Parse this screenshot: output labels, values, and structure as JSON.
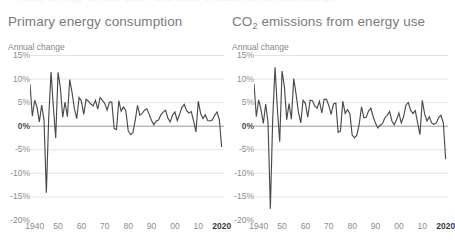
{
  "cut_text": "Primary energy consumption and CO2 emissions, annual change",
  "palette": {
    "background": "#ffffff",
    "title_color": "#7a7a7e",
    "axis_label_color": "#8a8a8e",
    "zero_label_color": "#4a4a4e",
    "gridline_color": "#e3e3e6",
    "zeroline_color": "#9a9a9e",
    "series_color": "#4a4a4d"
  },
  "panels": [
    {
      "id": "primary-energy-consumption",
      "title": "Primary energy consumption",
      "title_sub": "",
      "subtitle": "Annual change"
    },
    {
      "id": "co2-emissions-from-energy-use",
      "title": "CO",
      "title_sub": "2",
      "title_rest": " emissions from energy use",
      "subtitle": "Annual change"
    }
  ],
  "axes": {
    "y_ticks": [
      "15%",
      "10%",
      "5%",
      "0%",
      "-5%",
      "-10%",
      "-15%",
      "-20%"
    ],
    "y_values": [
      15,
      10,
      5,
      0,
      -5,
      -10,
      -15,
      -20
    ],
    "y_zero_index": 3,
    "x_ticks": [
      "1940",
      "50",
      "60",
      "70",
      "80",
      "90",
      "00",
      "10",
      "2020"
    ],
    "x_tick_years": [
      1940,
      1950,
      1960,
      1970,
      1980,
      1990,
      2000,
      2010,
      2020
    ],
    "x_bold_index": 8
  },
  "chart_data": {
    "type": "line",
    "xlabel": "",
    "ylabel": "Annual change",
    "ylim": [
      -20,
      15
    ],
    "xlim": [
      1938,
      2021
    ],
    "grid": true,
    "legend": "none",
    "x": [
      1938,
      1939,
      1940,
      1941,
      1942,
      1943,
      1944,
      1945,
      1946,
      1947,
      1948,
      1949,
      1950,
      1951,
      1952,
      1953,
      1954,
      1955,
      1956,
      1957,
      1958,
      1959,
      1960,
      1961,
      1962,
      1963,
      1964,
      1965,
      1966,
      1967,
      1968,
      1969,
      1970,
      1971,
      1972,
      1973,
      1974,
      1975,
      1976,
      1977,
      1978,
      1979,
      1980,
      1981,
      1982,
      1983,
      1984,
      1985,
      1986,
      1987,
      1988,
      1989,
      1990,
      1991,
      1992,
      1993,
      1994,
      1995,
      1996,
      1997,
      1998,
      1999,
      2000,
      2001,
      2002,
      2003,
      2004,
      2005,
      2006,
      2007,
      2008,
      2009,
      2010,
      2011,
      2012,
      2013,
      2014,
      2015,
      2016,
      2017,
      2018,
      2019,
      2020
    ],
    "series": [
      {
        "name": "Primary energy consumption",
        "panel": "primary-energy-consumption",
        "values": [
          8.8,
          2.0,
          5.4,
          3.9,
          0.8,
          4.4,
          1.2,
          -14.2,
          1.7,
          11.4,
          4.0,
          -2.6,
          11.3,
          8.0,
          1.8,
          5.0,
          1.9,
          9.8,
          7.0,
          3.6,
          1.5,
          6.0,
          5.2,
          2.4,
          5.6,
          5.2,
          4.6,
          4.2,
          5.4,
          3.5,
          6.0,
          5.4,
          4.7,
          3.3,
          5.0,
          5.0,
          -0.6,
          -0.8,
          5.3,
          3.1,
          4.0,
          3.2,
          -1.0,
          -1.9,
          -1.5,
          1.1,
          4.3,
          2.2,
          2.6,
          3.3,
          3.6,
          2.4,
          1.1,
          0.2,
          1.0,
          1.2,
          2.3,
          2.9,
          3.3,
          1.6,
          0.8,
          2.3,
          2.9,
          1.1,
          2.4,
          3.9,
          4.5,
          3.2,
          2.7,
          3.0,
          1.0,
          -1.3,
          5.2,
          2.6,
          1.5,
          2.3,
          1.1,
          1.0,
          1.2,
          2.2,
          2.9,
          1.3,
          -4.5
        ]
      },
      {
        "name": "CO2 emissions from energy use",
        "panel": "co2-emissions-from-energy-use",
        "values": [
          8.9,
          1.9,
          5.5,
          3.4,
          0.5,
          4.6,
          0.6,
          -17.6,
          1.4,
          12.4,
          3.6,
          -3.4,
          11.6,
          8.3,
          1.3,
          4.7,
          1.4,
          10.0,
          6.7,
          2.9,
          0.6,
          5.4,
          4.7,
          1.8,
          5.4,
          5.3,
          4.2,
          3.7,
          5.2,
          2.7,
          5.6,
          5.6,
          4.3,
          2.4,
          4.6,
          4.8,
          -1.4,
          -1.1,
          5.2,
          2.6,
          3.4,
          2.6,
          -2.0,
          -2.6,
          -2.0,
          0.3,
          4.0,
          1.7,
          1.8,
          3.1,
          3.7,
          1.9,
          0.5,
          -0.5,
          0.1,
          0.5,
          1.7,
          2.2,
          3.0,
          1.0,
          0.2,
          1.3,
          2.7,
          0.6,
          1.9,
          4.4,
          4.9,
          3.3,
          2.6,
          3.2,
          0.6,
          -1.9,
          5.4,
          2.5,
          1.0,
          1.9,
          0.6,
          0.3,
          0.6,
          1.7,
          2.2,
          0.6,
          -7.1
        ]
      }
    ]
  }
}
